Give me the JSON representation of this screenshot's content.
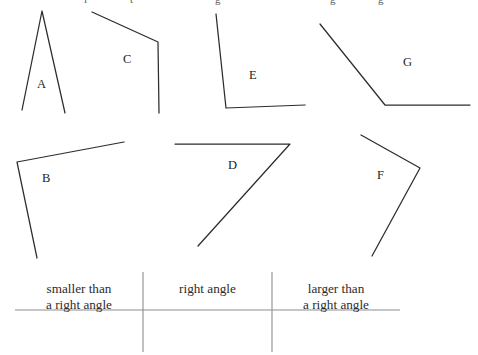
{
  "worksheet": {
    "title_fragment_row": [
      {
        "text": "i",
        "x": 84
      },
      {
        "text": "t",
        "x": 130
      },
      {
        "text": "g",
        "x": 215
      },
      {
        "text": "g",
        "x": 330
      },
      {
        "text": "g",
        "x": 378
      }
    ],
    "angles": [
      {
        "id": "A",
        "label": "A",
        "label_x": 37,
        "label_y": 78,
        "vertex": {
          "x": 42,
          "y": 11
        },
        "arm1": {
          "x": 22,
          "y": 110
        },
        "arm2": {
          "x": 65,
          "y": 113
        },
        "classification": "smaller than a right angle"
      },
      {
        "id": "B",
        "label": "B",
        "label_x": 42,
        "label_y": 172,
        "vertex": {
          "x": 17,
          "y": 162
        },
        "arm1": {
          "x": 124,
          "y": 142
        },
        "arm2": {
          "x": 37,
          "y": 258
        },
        "classification": "right angle"
      },
      {
        "id": "C",
        "label": "C",
        "label_x": 123,
        "label_y": 53,
        "vertex": {
          "x": 158,
          "y": 42
        },
        "arm1": {
          "x": 92,
          "y": 12
        },
        "arm2": {
          "x": 159,
          "y": 113
        },
        "classification": "larger than a right angle"
      },
      {
        "id": "D",
        "label": "D",
        "label_x": 228,
        "label_y": 159,
        "vertex": {
          "x": 290,
          "y": 144
        },
        "arm1": {
          "x": 175,
          "y": 144
        },
        "arm2": {
          "x": 198,
          "y": 246
        },
        "classification": "smaller than a right angle"
      },
      {
        "id": "E",
        "label": "E",
        "label_x": 249,
        "label_y": 69,
        "vertex": {
          "x": 226,
          "y": 108
        },
        "arm1": {
          "x": 216,
          "y": 14
        },
        "arm2": {
          "x": 305,
          "y": 105
        },
        "classification": "right angle"
      },
      {
        "id": "F",
        "label": "F",
        "label_x": 377,
        "label_y": 169,
        "vertex": {
          "x": 420,
          "y": 168
        },
        "arm1": {
          "x": 361,
          "y": 135
        },
        "arm2": {
          "x": 372,
          "y": 256
        },
        "classification": "smaller than a right angle"
      },
      {
        "id": "G",
        "label": "G",
        "label_x": 403,
        "label_y": 56,
        "vertex": {
          "x": 385,
          "y": 105
        },
        "arm1": {
          "x": 320,
          "y": 24
        },
        "arm2": {
          "x": 470,
          "y": 105
        },
        "classification": "larger than a right angle"
      }
    ],
    "sorting_table": {
      "columns": [
        {
          "label": "smaller than\na right angle",
          "center_x": 77
        },
        {
          "label": "right angle",
          "center_x": 207
        },
        {
          "label": "larger than\na right angle",
          "center_x": 337
        }
      ],
      "rule_y": 310,
      "rule_x_start": 15,
      "rule_x_end": 400,
      "divider_x": [
        143,
        272
      ],
      "divider_y_start": 272,
      "divider_y_end": 352,
      "header_top_y": 281
    },
    "stroke_color": "#2e2b2c",
    "rule_color": "#8d8d8d"
  }
}
